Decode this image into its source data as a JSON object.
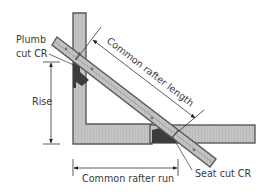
{
  "diagram": {
    "labels": {
      "plumb_cut_line1": "Plumb",
      "plumb_cut_line2": "cut CR",
      "rise": "Rise",
      "common_rafter_length": "Common rafter length",
      "common_rafter_run": "Common rafter run",
      "seat_cut": "Seat cut CR"
    },
    "colors": {
      "member_fill": "#bdbdbd",
      "member_stroke": "#5a5a5a",
      "dark_block": "#3c3c3c",
      "line": "#333333",
      "text": "#3a3a3a",
      "background": "#ffffff"
    }
  }
}
